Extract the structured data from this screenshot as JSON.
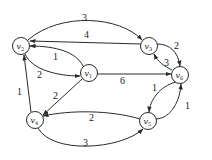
{
  "diagram": {
    "type": "weighted-directed-graph",
    "nodes": [
      {
        "id": "v1",
        "label": "v",
        "sub": "1",
        "x": 89,
        "y": 73
      },
      {
        "id": "v2",
        "label": "v",
        "sub": "2",
        "x": 21,
        "y": 46
      },
      {
        "id": "v3",
        "label": "v",
        "sub": "3",
        "x": 149,
        "y": 46
      },
      {
        "id": "v4",
        "label": "v",
        "sub": "4",
        "x": 35,
        "y": 120
      },
      {
        "id": "v5",
        "label": "v",
        "sub": "5",
        "x": 148,
        "y": 121
      },
      {
        "id": "v6",
        "label": "v",
        "sub": "6",
        "x": 180,
        "y": 75
      }
    ],
    "edges": [
      {
        "from": "v2",
        "to": "v3",
        "weight": "3"
      },
      {
        "from": "v3",
        "to": "v2",
        "weight": "4"
      },
      {
        "from": "v1",
        "to": "v2",
        "weight": "1"
      },
      {
        "from": "v2",
        "to": "v1",
        "weight": "2"
      },
      {
        "from": "v1",
        "to": "v6",
        "weight": "6"
      },
      {
        "from": "v3",
        "to": "v6",
        "weight": "2"
      },
      {
        "from": "v6",
        "to": "v3",
        "weight": "3"
      },
      {
        "from": "v1",
        "to": "v4",
        "weight": "2"
      },
      {
        "from": "v4",
        "to": "v2",
        "weight": "1"
      },
      {
        "from": "v5",
        "to": "v4",
        "weight": "2"
      },
      {
        "from": "v4",
        "to": "v5",
        "weight": "3"
      },
      {
        "from": "v6",
        "to": "v5",
        "weight": "1"
      },
      {
        "from": "v5",
        "to": "v6",
        "weight": "1"
      }
    ]
  }
}
